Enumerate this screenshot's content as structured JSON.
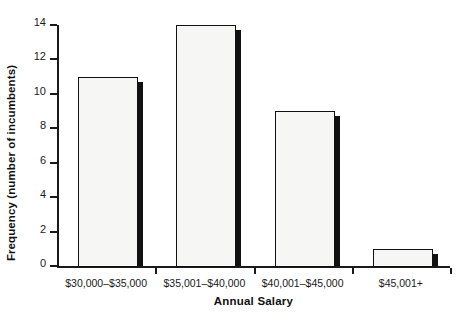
{
  "chart_data": {
    "type": "bar",
    "title": "",
    "xlabel": "Annual Salary",
    "ylabel": "Frequency (number of incumbents)",
    "categories": [
      "$30,000–$35,000",
      "$35,001–$40,000",
      "$40,001–$45,000",
      "$45,001+"
    ],
    "values": [
      11,
      14,
      9,
      1
    ],
    "ylim": [
      0,
      14
    ],
    "yticks": [
      0,
      2,
      4,
      6,
      8,
      10,
      12,
      14
    ],
    "ytick_labels": [
      "0",
      "2",
      "4",
      "6",
      "8",
      "10",
      "12",
      "14"
    ],
    "grid": false,
    "legend": false,
    "legend_position": "none",
    "colors": {
      "bar_fill": "#f6f6f5",
      "bar_outline": "#111111",
      "bar_shadow": "#111111",
      "axis": "#1a1a1a",
      "text": "#1a1a1a",
      "background": "#ffffff"
    }
  }
}
